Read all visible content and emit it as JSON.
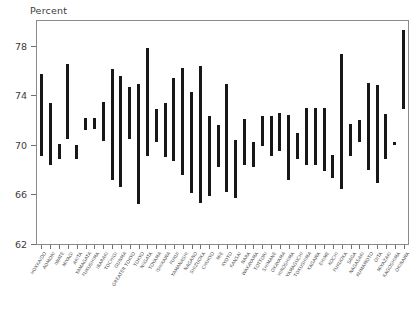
{
  "chart_data": {
    "type": "bar",
    "subtype": "range-bar",
    "title": "Percent",
    "xlabel": "",
    "ylabel": "Percent",
    "ylim": [
      62,
      80
    ],
    "yticks": [
      62,
      66,
      70,
      74,
      78
    ],
    "grid": false,
    "legend": null,
    "categories": [
      "HOKKAIDO",
      "AOMORI",
      "IWATE",
      "MIYAGI",
      "AKITA",
      "YAMAGATA",
      "FUKUSHIMA",
      "IBARAKI",
      "TOCHIGI",
      "GUNMA",
      "GREATER TOKYO",
      "TOKYO",
      "NIIGATA",
      "TOYAMA",
      "ISHIKAWA",
      "FUKUI",
      "YAMANASHI",
      "NAGANO",
      "SHIZUOKA",
      "CHUKYO",
      "MIE",
      "KYOTO",
      "KANSAI",
      "NARA",
      "WAKAYAMA",
      "TOTTORI",
      "SHIMANE",
      "OKAYAMA",
      "HIROSHIMA",
      "YAMAGUCHI",
      "TOKUSHIMA",
      "KAGAWA",
      "EHIME",
      "KOCHI",
      "FUKUOKA",
      "SAGA",
      "NAGASAKI",
      "KUMAMOTO",
      "OITA",
      "MIYAZAKI",
      "KAGOSHIMA",
      "OKINAWA"
    ],
    "series": [
      {
        "name": "range",
        "low": [
          69.1,
          68.4,
          68.9,
          70.5,
          68.9,
          71.2,
          71.3,
          70.3,
          67.2,
          66.6,
          70.5,
          65.2,
          69.1,
          70.2,
          69.0,
          68.7,
          67.6,
          66.1,
          65.3,
          65.9,
          68.2,
          66.2,
          65.7,
          68.4,
          68.2,
          69.9,
          69.1,
          69.5,
          67.2,
          68.9,
          68.4,
          68.4,
          67.9,
          67.3,
          66.4,
          69.1,
          70.2,
          68.0,
          66.9,
          68.9,
          70.0,
          72.9
        ],
        "high": [
          75.7,
          73.4,
          70.1,
          76.5,
          70.0,
          72.2,
          72.2,
          73.5,
          76.1,
          75.6,
          74.7,
          74.9,
          77.8,
          72.9,
          73.4,
          75.4,
          76.2,
          74.3,
          76.4,
          72.3,
          71.6,
          74.9,
          70.4,
          72.1,
          70.2,
          72.3,
          72.3,
          72.6,
          72.4,
          71.0,
          73.0,
          73.0,
          73.0,
          69.2,
          77.3,
          71.7,
          72.0,
          75.0,
          74.8,
          72.5,
          70.2,
          79.3
        ]
      }
    ]
  }
}
